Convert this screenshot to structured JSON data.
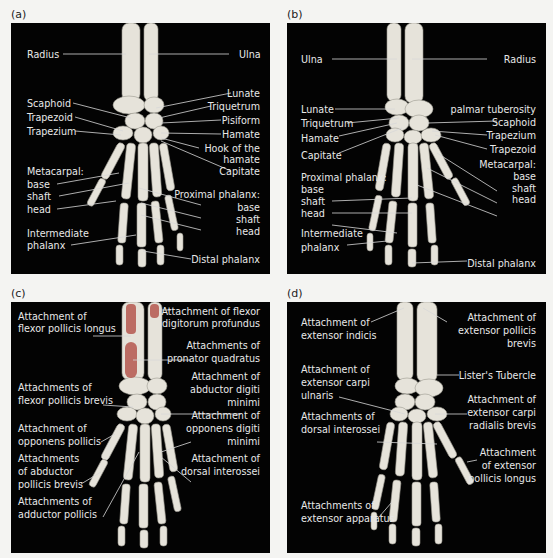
{
  "panels": {
    "a": {
      "letter": "(a)",
      "labels_left": {
        "radius": "Radius",
        "scaphoid": "Scaphoid",
        "trapezoid": "Trapezoid",
        "trapezium": "Trapezium",
        "metacarpal": "Metacarpal:",
        "base": "base",
        "shaft": "shaft",
        "head": "head",
        "intermediate1": "Intermediate",
        "intermediate2": "phalanx"
      },
      "labels_right": {
        "ulna": "Ulna",
        "lunate": "Lunate",
        "triquetrum": "Triquetrum",
        "pisiform": "Pisiform",
        "hamate": "Hamate",
        "hook1": "Hook of the",
        "hook2": "hamate",
        "capitate": "Capitate",
        "proximal": "Proximal phalanx:",
        "base": "base",
        "shaft": "shaft",
        "head": "head",
        "distal": "Distal phalanx"
      }
    },
    "b": {
      "letter": "(b)",
      "labels_left": {
        "ulna": "Ulna",
        "lunate": "Lunate",
        "triquetrum": "Triquetrum",
        "hamate": "Hamate",
        "capitate": "Capitate",
        "proximal": "Proximal phalanx:",
        "base": "base",
        "shaft": "shaft",
        "head": "head",
        "intermediate1": "Intermediate",
        "intermediate2": "phalanx"
      },
      "labels_right": {
        "radius": "Radius",
        "palmar": "palmar tuberosity",
        "scaphoid": "Scaphoid",
        "trapezium": "Trapezium",
        "trapezoid": "Trapezoid",
        "metacarpal": "Metacarpal:",
        "base": "base",
        "shaft": "shaft",
        "head": "head",
        "distal": "Distal phalanx"
      }
    },
    "c": {
      "letter": "(c)",
      "labels_left": {
        "fpl1": "Attachment of",
        "fpl2": "flexor pollicis longus",
        "fpb1": "Attachments of",
        "fpb2": "flexor pollicis brevis",
        "op1": "Attachment of",
        "op2": "opponens pollicis",
        "apb1": "Attachments",
        "apb2": "of abductor",
        "apb3": "pollicis brevis",
        "ap1": "Attachments of",
        "ap2": "adductor pollicis"
      },
      "labels_right": {
        "fdp1": "Attachment of flexor",
        "fdp2": "digitorum profundus",
        "pq1": "Attachments of",
        "pq2": "pronator quadratus",
        "adm1": "Attachment of",
        "adm2": "abductor digiti",
        "adm3": "minimi",
        "odm1": "Attachment of",
        "odm2": "opponens digiti",
        "odm3": "minimi",
        "di1": "Attachment of",
        "di2": "dorsal interossei"
      }
    },
    "d": {
      "letter": "(d)",
      "labels_left": {
        "ei1": "Attachment of",
        "ei2": "extensor indicis",
        "ecu1": "Attachment of",
        "ecu2": "extensor carpi",
        "ecu3": "ulnaris",
        "di1": "Attachments of",
        "di2": "dorsal interossei",
        "ea1": "Attachments of",
        "ea2": "extensor apparatus"
      },
      "labels_right": {
        "epb1": "Attachment of",
        "epb2": "extensor pollicis",
        "epb3": "brevis",
        "lister": "Lister's Tubercle",
        "ecrb1": "Attachment of",
        "ecrb2": "extensor carpi",
        "ecrb3": "radialis brevis",
        "epl1": "Attachment",
        "epl2": "of extensor",
        "epl3": "pollicis longus"
      }
    }
  },
  "colors": {
    "background": "#f4f4f2",
    "panel": "#030303",
    "bone": "#e6e3da",
    "muscle_attachment": "#b5584f",
    "label_text": "#e8e8e8"
  }
}
